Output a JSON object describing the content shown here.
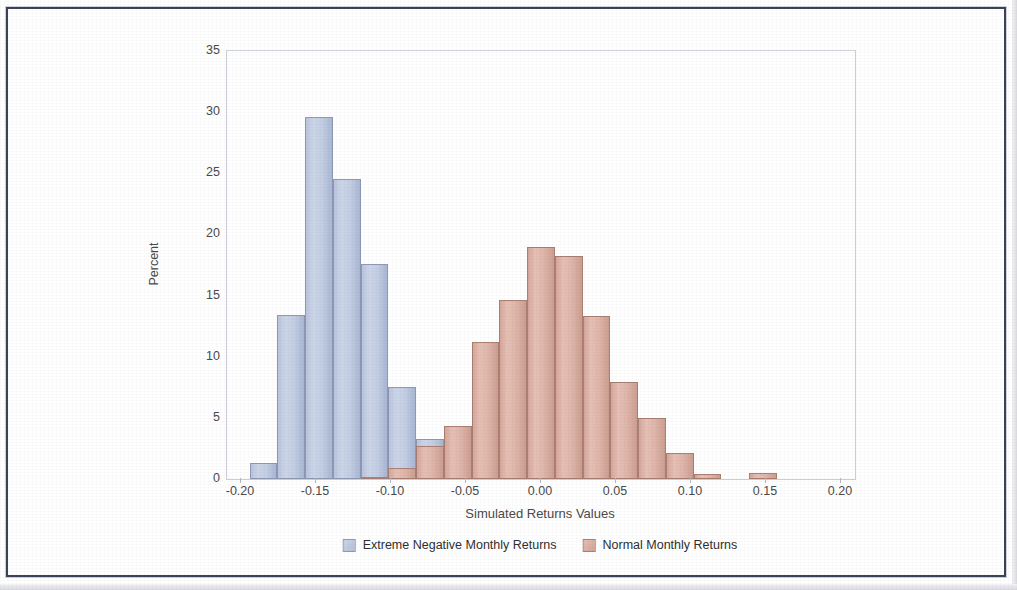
{
  "chart_data": {
    "type": "bar",
    "title": "Simulating Extreme 1-Month S&P 500 Index Stock Returns",
    "subtitle": "Minimum Stock Returns From Gumbel Distribution",
    "xlabel": "Simulated Returns Values",
    "ylabel": "Percent",
    "xlim": [
      -0.2,
      0.2
    ],
    "ylim": [
      0,
      35
    ],
    "xticks": [
      "-0.20",
      "-0.15",
      "-0.10",
      "-0.05",
      "0.00",
      "0.05",
      "0.10",
      "0.15",
      "0.20"
    ],
    "xtick_values": [
      -0.2,
      -0.15,
      -0.1,
      -0.05,
      0.0,
      0.05,
      0.1,
      0.15,
      0.2
    ],
    "yticks": [
      "0",
      "5",
      "10",
      "15",
      "20",
      "25",
      "30",
      "35"
    ],
    "ytick_values": [
      0,
      5,
      10,
      15,
      20,
      25,
      30,
      35
    ],
    "grid": false,
    "legend_position": "bottom",
    "bin_width": 0.0185,
    "series": [
      {
        "name": "Extreme Negative Monthly Returns",
        "color": "#c3cee4",
        "edge_color": "#8e99b5",
        "bin_centers": [
          -0.185,
          -0.1665,
          -0.148,
          -0.1295,
          -0.111,
          -0.0925,
          -0.074
        ],
        "values": [
          1.3,
          13.4,
          29.6,
          24.5,
          17.6,
          7.5,
          3.3
        ]
      },
      {
        "name": "Normal Monthly Returns",
        "color": "#dfb5a9",
        "edge_color": "#ab7f73",
        "bin_centers": [
          -0.111,
          -0.0925,
          -0.074,
          -0.0555,
          -0.037,
          -0.0185,
          0.0,
          0.0185,
          0.037,
          0.0555,
          0.074,
          0.0925,
          0.111,
          0.1295,
          0.148
        ],
        "values": [
          0.2,
          0.9,
          2.7,
          4.3,
          11.2,
          14.6,
          19.0,
          18.2,
          13.3,
          7.9,
          5.0,
          2.1,
          0.4,
          0.0,
          0.5
        ]
      }
    ]
  },
  "legend": {
    "items": [
      {
        "label": "Extreme Negative Monthly Returns",
        "swatch": "blue"
      },
      {
        "label": "Normal Monthly Returns",
        "swatch": "red"
      }
    ]
  },
  "colors": {
    "title": "#4a58a0",
    "subtitle": "#8f98c4",
    "series_blue": "#c3cee4",
    "series_red": "#dfb5a9",
    "axis_text": "#4a4a4a",
    "frame": "#3d4356"
  }
}
